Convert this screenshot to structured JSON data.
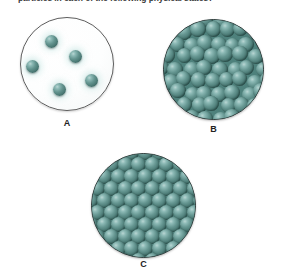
{
  "question": {
    "text": "particles in each of the following physical states?"
  },
  "colors": {
    "sphere_base": "#4a7d78",
    "sphere_highlight": "#b9d6d3",
    "sphere_shadow": "#24433f",
    "circle_outline": "#5d5d5d",
    "packed_outline": "#2f3b3a",
    "gas_fill": "#ffffff",
    "label_color": "#222222",
    "text_color": "#3a3a3a"
  },
  "panels": [
    {
      "id": "a",
      "label": "A",
      "state": "gas",
      "arrangement": "scattered",
      "circle": {
        "x": 20,
        "y": 17,
        "size": 94
      },
      "sphere_size": 13,
      "spheres": [
        {
          "x": 44,
          "y": 34
        },
        {
          "x": 68,
          "y": 49
        },
        {
          "x": 25,
          "y": 59
        },
        {
          "x": 84,
          "y": 73
        },
        {
          "x": 52,
          "y": 82
        }
      ],
      "label_pos": {
        "x": 20,
        "y": 118,
        "width": 94
      }
    },
    {
      "id": "b",
      "label": "B",
      "state": "liquid",
      "arrangement": "close-packed-random",
      "circle": {
        "x": 163,
        "y": 19,
        "size": 101
      },
      "sphere_size": 15.5,
      "rows": 8,
      "cols": 8,
      "jitter": 2.2,
      "label_pos": {
        "x": 163,
        "y": 124,
        "width": 101
      }
    },
    {
      "id": "c",
      "label": "C",
      "state": "solid",
      "arrangement": "ordered-lattice",
      "circle": {
        "x": 91,
        "y": 153,
        "size": 105
      },
      "sphere_size": 15,
      "rows": 8,
      "cols": 8,
      "jitter": 0,
      "label_pos": {
        "x": 91,
        "y": 259,
        "width": 105
      }
    }
  ]
}
